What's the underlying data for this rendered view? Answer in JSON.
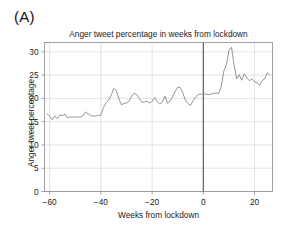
{
  "panel": {
    "label": "(A)"
  },
  "chart_data": {
    "type": "line",
    "title": "Anger tweet percentage in weeks from lockdown",
    "xlabel": "Weeks from lockdown",
    "ylabel": "Anger tweet percentage",
    "xlim": [
      -62,
      27
    ],
    "ylim": [
      0,
      32
    ],
    "xticks": [
      -60,
      -40,
      -20,
      0,
      20
    ],
    "xticklabels": [
      "−60",
      "−40",
      "−20",
      "0",
      "20"
    ],
    "yticks": [
      0,
      5,
      10,
      15,
      20,
      25,
      30
    ],
    "yticklabels": [
      "0",
      "5",
      "10",
      "15",
      "20",
      "25",
      "30"
    ],
    "grid": true,
    "grid_axis": "both",
    "legend": "none",
    "line_color": "#8a8a8a",
    "grid_color": "#d8d8d8",
    "axis_color": "#8a8a8a",
    "annotations": [
      {
        "type": "vline",
        "x": 0,
        "label": "lockdown",
        "color": "#555555"
      }
    ],
    "series": [
      {
        "name": "Anger tweet percentage",
        "x": [
          -61,
          -60,
          -59,
          -58,
          -57,
          -56,
          -55,
          -54,
          -53,
          -52,
          -51,
          -50,
          -49,
          -48,
          -47,
          -46,
          -45,
          -44,
          -43,
          -42,
          -41,
          -40,
          -39,
          -38,
          -37,
          -36,
          -35,
          -34,
          -33,
          -32,
          -31,
          -30,
          -29,
          -28,
          -27,
          -26,
          -25,
          -24,
          -23,
          -22,
          -21,
          -20,
          -19,
          -18,
          -17,
          -16,
          -15,
          -14,
          -13,
          -12,
          -11,
          -10,
          -9,
          -8,
          -7,
          -6,
          -5,
          -4,
          -3,
          -2,
          -1,
          0,
          1,
          2,
          3,
          4,
          5,
          6,
          7,
          8,
          9,
          10,
          11,
          12,
          13,
          14,
          15,
          16,
          17,
          18,
          19,
          20,
          21,
          22,
          23,
          24,
          25,
          26
        ],
        "values": [
          16.7,
          16.2,
          15.4,
          16.2,
          15.6,
          16.4,
          16.3,
          16.6,
          15.8,
          16.0,
          16.0,
          16.0,
          16.0,
          16.0,
          16.3,
          17.1,
          16.7,
          16.3,
          16.2,
          16.2,
          16.3,
          16.4,
          18.0,
          19.0,
          19.6,
          20.6,
          22.1,
          21.7,
          20.0,
          18.6,
          18.9,
          19.0,
          19.4,
          20.5,
          21.1,
          20.8,
          20.0,
          19.2,
          19.2,
          19.4,
          19.0,
          19.3,
          20.2,
          19.3,
          18.8,
          19.2,
          20.5,
          19.0,
          19.4,
          20.3,
          21.5,
          22.4,
          22.3,
          21.2,
          19.6,
          18.9,
          18.5,
          19.5,
          20.3,
          20.8,
          20.9,
          20.9,
          20.9,
          20.8,
          20.9,
          21.1,
          21.1,
          21.1,
          22.6,
          25.9,
          27.2,
          30.3,
          31.0,
          27.2,
          24.2,
          25.1,
          23.9,
          25.3,
          24.4,
          23.8,
          24.2,
          23.6,
          23.3,
          22.8,
          23.8,
          24.3,
          25.5,
          25.0
        ]
      }
    ]
  }
}
